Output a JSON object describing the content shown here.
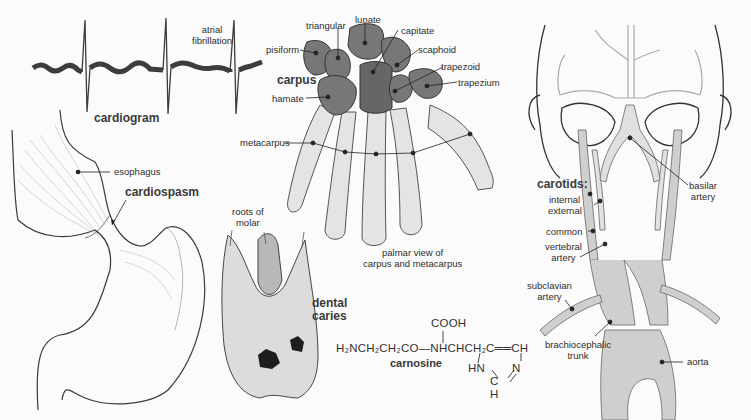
{
  "figures": {
    "cardiogram": {
      "title": "cardiogram",
      "annotation_line1": "atrial",
      "annotation_line2": "fibrillation"
    },
    "stomach": {
      "labels": {
        "esophagus": "esophagus",
        "cardiospasm": "cardiospasm"
      }
    },
    "hand": {
      "title": "carpus",
      "labels": {
        "triangular": "triangular",
        "lunate": "lunate",
        "capitate": "capitate",
        "pisiform": "pisiform",
        "scaphoid": "scaphoid",
        "trapezoid": "trapezoid",
        "trapezium": "trapezium",
        "hamate": "hamate",
        "metacarpus": "metacarpus"
      },
      "caption_line1": "palmar view of",
      "caption_line2": "carpus and metacarpus"
    },
    "tooth": {
      "roots_line1": "roots of",
      "roots_line2": "molar",
      "title_line1": "dental",
      "title_line2": "caries"
    },
    "carnosine": {
      "name": "carnosine",
      "formula_main": "H₂NCH₂CH₂CO—NHCHCH₂C══CH",
      "formula_top": "COOH",
      "ring_hn": "HN",
      "ring_n": "N",
      "ring_c": "C",
      "ring_h": "H"
    },
    "arteries": {
      "title": "carotids:",
      "labels": {
        "internal": "internal",
        "external": "external",
        "common": "common",
        "vertebral_line1": "vertebral",
        "vertebral_line2": "artery",
        "basilar_line1": "basilar",
        "basilar_line2": "artery",
        "subclavian_line1": "subclavian",
        "subclavian_line2": "artery",
        "brachio_line1": "brachiocephalic",
        "brachio_line2": "trunk",
        "aorta": "aorta"
      }
    }
  },
  "colors": {
    "ink": "#2b2b2b",
    "bone": "#d9d9d9",
    "bone_dark": "#6e6e6e",
    "vessel": "#c8c8c8",
    "background": "#fbfbfb"
  }
}
